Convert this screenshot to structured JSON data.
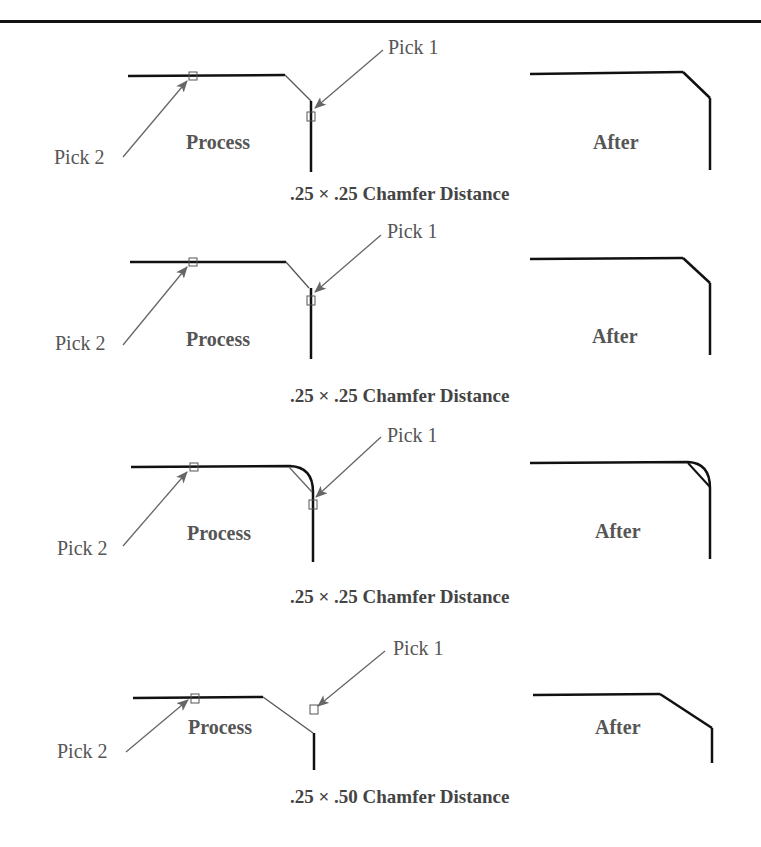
{
  "figure": {
    "panels": [
      {
        "pick1_label": "Pick 1",
        "pick2_label": "Pick 2",
        "process_label": "Process",
        "after_label": "After",
        "caption": ".25 × .25 Chamfer Distance",
        "corner_type": "chamfer"
      },
      {
        "pick1_label": "Pick 1",
        "pick2_label": "Pick 2",
        "process_label": "Process",
        "after_label": "After",
        "caption": ".25 × .25 Chamfer Distance",
        "corner_type": "chamfer"
      },
      {
        "pick1_label": "Pick 1",
        "pick2_label": "Pick 2",
        "process_label": "Process",
        "after_label": "After",
        "caption": ".25 × .25 Chamfer Distance",
        "corner_type": "fillet-to-chamfer"
      },
      {
        "pick1_label": "Pick 1",
        "pick2_label": "Pick 2",
        "process_label": "Process",
        "after_label": "After",
        "caption": ".25 × .50 Chamfer Distance",
        "corner_type": "chamfer"
      }
    ]
  }
}
